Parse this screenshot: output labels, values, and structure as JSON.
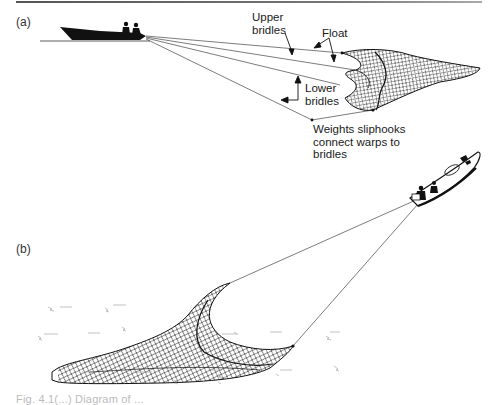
{
  "figure": {
    "panels": [
      {
        "id": "a",
        "label": "(a)",
        "annotations": {
          "upper_bridles_line1": "Upper",
          "upper_bridles_line2": "bridles",
          "float": "Float",
          "lower_bridles_line1": "Lower",
          "lower_bridles_line2": "bridles",
          "weights_line1": "Weights sliphooks",
          "weights_line2": "connect warps to",
          "weights_line3": "bridles"
        }
      },
      {
        "id": "b",
        "label": "(b)"
      }
    ],
    "caption": "Fig. 4.1(...) Diagram of ..."
  },
  "colors": {
    "ink": "#111111",
    "line": "#444444",
    "rule": "#666666",
    "background": "#ffffff"
  }
}
